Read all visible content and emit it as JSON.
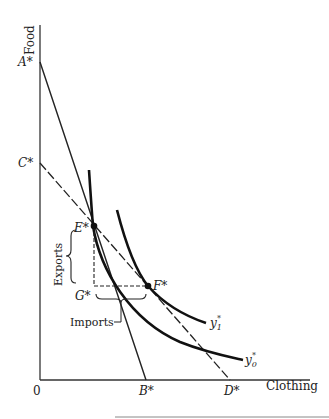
{
  "diagram": {
    "axes": {
      "y_label": "Food",
      "x_label": "Clothing",
      "origin_label": "0"
    },
    "points": {
      "A": "A*",
      "B": "B*",
      "C": "C*",
      "D": "D*",
      "E": "E*",
      "F": "F*",
      "G": "G*"
    },
    "curves": {
      "y0": {
        "label": "y",
        "sub": "0",
        "sup": "*"
      },
      "y1": {
        "label": "y",
        "sub": "1",
        "sup": "*"
      }
    },
    "annotations": {
      "exports": "Exports",
      "imports": "Imports"
    },
    "colors": {
      "ink": "#222222",
      "background": "#ffffff"
    }
  }
}
